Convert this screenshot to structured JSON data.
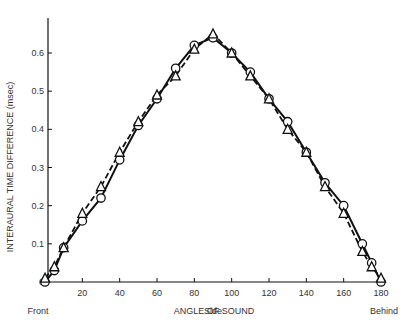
{
  "chart_data": {
    "type": "line",
    "title": "",
    "xlabel": "ANGLE OF SOUND",
    "ylabel": "INTERAURAL TIME DIFFERENCE (msec)",
    "xlim": [
      0,
      180
    ],
    "ylim": [
      0,
      0.7
    ],
    "grid": false,
    "x_ticks": [
      20,
      40,
      60,
      80,
      100,
      120,
      140,
      160,
      180
    ],
    "y_ticks": [
      0,
      0.1,
      0.2,
      0.3,
      0.4,
      0.5,
      0.6
    ],
    "y_tick_labels": [
      "0",
      "0.1",
      "0.2",
      "0.3",
      "0.4",
      "0.5",
      "0.6"
    ],
    "annotations": [
      {
        "text": "Front",
        "x": 0
      },
      {
        "text": "Side",
        "x": 90
      },
      {
        "text": "Behind",
        "x": 180
      }
    ],
    "x": [
      0,
      5,
      10,
      20,
      30,
      40,
      50,
      60,
      70,
      80,
      90,
      100,
      110,
      120,
      130,
      140,
      150,
      160,
      170,
      175,
      180
    ],
    "series": [
      {
        "name": "circles (solid line)",
        "marker": "circle",
        "line": "solid",
        "values": [
          0,
          0.03,
          0.09,
          0.16,
          0.22,
          0.32,
          0.41,
          0.48,
          0.56,
          0.62,
          0.64,
          0.6,
          0.55,
          0.48,
          0.42,
          0.34,
          0.26,
          0.2,
          0.1,
          0.05,
          0
        ]
      },
      {
        "name": "triangles (dashed line)",
        "marker": "triangle",
        "line": "dashed",
        "values": [
          0.01,
          0.04,
          0.09,
          0.18,
          0.25,
          0.34,
          0.42,
          0.49,
          0.54,
          0.61,
          0.65,
          0.6,
          0.54,
          0.48,
          0.4,
          0.34,
          0.25,
          0.18,
          0.08,
          0.04,
          0.01
        ]
      }
    ]
  }
}
